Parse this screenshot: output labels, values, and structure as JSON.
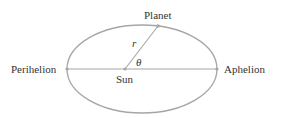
{
  "diagram": {
    "type": "elliptical orbit",
    "labels": {
      "planet": "Planet",
      "sun": "Sun",
      "perihelion": "Perihelion",
      "aphelion": "Aphelion",
      "radius": "r",
      "angle": "θ"
    },
    "colors": {
      "curve": "#a6a6a6",
      "text": "#333333"
    }
  }
}
